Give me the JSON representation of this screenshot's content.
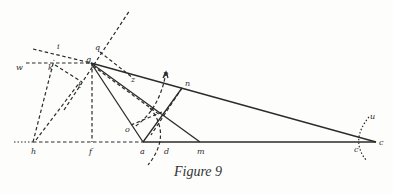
{
  "figure": {
    "caption": "Figure 9",
    "points": {
      "g": {
        "label": "g",
        "x": 91,
        "y": 63
      },
      "q": {
        "label": "q",
        "x": 97,
        "y": 49
      },
      "i": {
        "label": "i",
        "x": 58,
        "y": 46
      },
      "w": {
        "label": "w",
        "x": 18,
        "y": 69
      },
      "k": {
        "label": "k",
        "x": 53,
        "y": 72
      },
      "t": {
        "label": "t",
        "x": 80,
        "y": 87
      },
      "z": {
        "label": "z",
        "x": 132,
        "y": 81
      },
      "p": {
        "label": "p",
        "x": 164,
        "y": 76
      },
      "n": {
        "label": "n",
        "x": 186,
        "y": 84
      },
      "o": {
        "label": "o",
        "x": 126,
        "y": 131
      },
      "h": {
        "label": "h",
        "x": 32,
        "y": 152
      },
      "f": {
        "label": "f",
        "x": 91,
        "y": 152
      },
      "a": {
        "label": "a",
        "x": 141,
        "y": 152
      },
      "d": {
        "label": "d",
        "x": 164,
        "y": 152
      },
      "m": {
        "label": "m",
        "x": 199,
        "y": 152
      },
      "c_arc": {
        "label": "c",
        "x": 354,
        "y": 150
      },
      "c": {
        "label": "c",
        "x": 380,
        "y": 145
      },
      "u": {
        "label": "u",
        "x": 370,
        "y": 119
      }
    },
    "colors": {
      "ink": "#2b2b2b",
      "paper": "#fdfdfc"
    }
  }
}
